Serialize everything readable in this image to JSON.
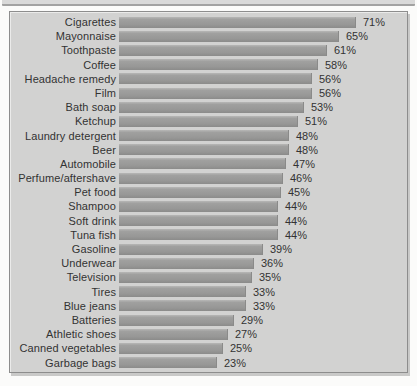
{
  "figure": {
    "kind": "horizontal-bar-chart-figure",
    "title": "",
    "panel_background": "#d2d2d1",
    "panel_border_color": "#8d8d8d",
    "top_rule_color": "#a2a2a2",
    "bar_color": "#9a9a99",
    "text_color": "#333333"
  },
  "chart_data": {
    "type": "bar",
    "orientation": "horizontal",
    "title": "",
    "xlabel": "",
    "ylabel": "",
    "grid": false,
    "legend": null,
    "value_suffix": "%",
    "xlim": [
      0,
      80
    ],
    "categories": [
      "Cigarettes",
      "Mayonnaise",
      "Toothpaste",
      "Coffee",
      "Headache remedy",
      "Film",
      "Bath soap",
      "Ketchup",
      "Laundry detergent",
      "Beer",
      "Automobile",
      "Perfume/aftershave",
      "Pet food",
      "Shampoo",
      "Soft drink",
      "Tuna fish",
      "Gasoline",
      "Underwear",
      "Television",
      "Tires",
      "Blue jeans",
      "Batteries",
      "Athletic shoes",
      "Canned vegetables",
      "Garbage bags"
    ],
    "values": [
      71,
      65,
      61,
      58,
      56,
      56,
      53,
      51,
      48,
      48,
      47,
      46,
      45,
      44,
      44,
      44,
      39,
      36,
      35,
      33,
      33,
      29,
      27,
      25,
      23
    ],
    "value_labels": [
      "71%",
      "65%",
      "61%",
      "58%",
      "56%",
      "56%",
      "53%",
      "51%",
      "48%",
      "48%",
      "47%",
      "46%",
      "45%",
      "44%",
      "44%",
      "44%",
      "39%",
      "36%",
      "35%",
      "33%",
      "33%",
      "29%",
      "27%",
      "25%",
      "23%"
    ]
  }
}
